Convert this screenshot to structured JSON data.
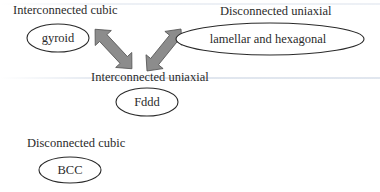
{
  "diagram": {
    "groups": [
      {
        "id": "interconnected-cubic",
        "category_label": "Interconnected cubic",
        "node_label": "gyroid"
      },
      {
        "id": "disconnected-uniaxial",
        "category_label": "Disconnected uniaxial",
        "node_label": "lamellar and hexagonal"
      },
      {
        "id": "interconnected-uniaxial",
        "category_label": "Interconnected uniaxial",
        "node_label": "Fddd"
      },
      {
        "id": "disconnected-cubic",
        "category_label": "Disconnected cubic",
        "node_label": "BCC"
      }
    ],
    "edges": [
      {
        "from": "gyroid",
        "to": "Fddd",
        "type": "bidirectional",
        "icon": "double-arrow-icon"
      },
      {
        "from": "lamellar and hexagonal",
        "to": "Fddd",
        "type": "bidirectional",
        "icon": "double-arrow-icon"
      }
    ],
    "colors": {
      "arrow_fill": "#8c8c8c",
      "arrow_stroke": "#555555",
      "ellipse_stroke": "#2a2a2a",
      "text": "#2b2b2b",
      "background": "#ffffff"
    }
  }
}
